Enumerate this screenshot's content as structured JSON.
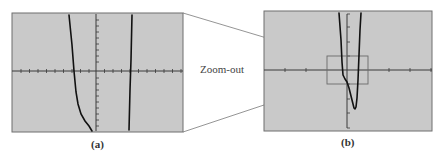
{
  "figure": {
    "connector_label": "Zoom-out",
    "panels": [
      {
        "id": "a",
        "caption": "(a)",
        "screen_color": "#c9c9c9",
        "description": "Zoomed-in calculator viewing window showing two steep branches of the graph"
      },
      {
        "id": "b",
        "caption": "(b)",
        "screen_color": "#c9c9c9",
        "description": "Zoomed-out calculator viewing window showing the full graph with a local minimum below the x-axis; a rectangle marks the region shown in (a)"
      }
    ],
    "colors": {
      "screen": "#c9c9c9",
      "border": "#6f6f6f",
      "curve": "#111111",
      "axis": "#3a3a3a",
      "connector": "#7a7a7a"
    }
  }
}
